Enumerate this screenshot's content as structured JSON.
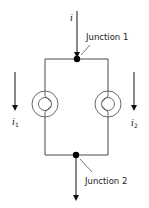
{
  "diagram": {
    "type": "circuit",
    "input_current": {
      "symbol": "i",
      "direction": "down"
    },
    "output_current": {
      "direction": "down"
    },
    "junctions": [
      {
        "id": "junction-1",
        "label": "Junction 1"
      },
      {
        "id": "junction-2",
        "label": "Junction 2"
      }
    ],
    "branches": [
      {
        "id": "branch-1",
        "element": "bulb",
        "current_symbol": "i",
        "current_subscript": "1",
        "direction": "down"
      },
      {
        "id": "branch-2",
        "element": "bulb",
        "current_symbol": "i",
        "current_subscript": "2",
        "direction": "down"
      }
    ],
    "colors": {
      "wire": "#4a4a4a",
      "junction_dot": "#000000",
      "background": "#ffffff"
    }
  }
}
